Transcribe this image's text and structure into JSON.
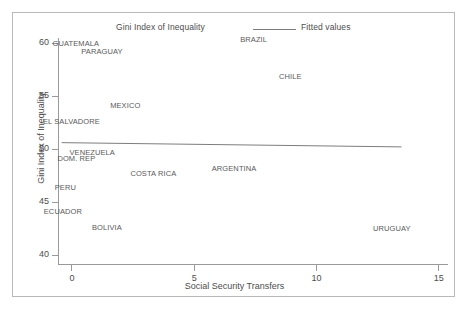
{
  "chart_data": {
    "type": "scatter",
    "title": "",
    "xlabel": "Social Security Transfers",
    "ylabel": "Gini Index of Inequality",
    "xlim": [
      -0.55,
      15.4
    ],
    "ylim": [
      39.2,
      60.9
    ],
    "xticks": [
      "0",
      "5",
      "10",
      "15"
    ],
    "xtick_values": [
      0,
      5,
      10,
      15
    ],
    "yticks": [
      "40",
      "45",
      "50",
      "55",
      "60"
    ],
    "ytick_values": [
      40,
      45,
      50,
      55,
      60
    ],
    "grid": false,
    "legend_position": "top",
    "legend": [
      {
        "name": "Gini Index of Inequality",
        "marker": "text-label"
      },
      {
        "name": "Fitted values",
        "marker": "line"
      }
    ],
    "point_marker_style": "country-name-text",
    "points": [
      {
        "label": "GUATEMALA",
        "x": 0.18,
        "y": 59.95
      },
      {
        "label": "PARAGUAY",
        "x": 1.25,
        "y": 59.2
      },
      {
        "label": "BRAZIL",
        "x": 7.45,
        "y": 60.3
      },
      {
        "label": "CHILE",
        "x": 8.95,
        "y": 56.85
      },
      {
        "label": "MEXICO",
        "x": 2.2,
        "y": 54.1
      },
      {
        "label": "EL SALVADORE",
        "x": 0.0,
        "y": 52.65
      },
      {
        "label": "VENEZUELA",
        "x": 0.85,
        "y": 49.75
      },
      {
        "label": "DOM. REP",
        "x": 0.2,
        "y": 49.15
      },
      {
        "label": "ARGENTINA",
        "x": 6.65,
        "y": 48.25
      },
      {
        "label": "COSTA RICA",
        "x": 3.35,
        "y": 47.75
      },
      {
        "label": "PERU",
        "x": -0.25,
        "y": 46.45
      },
      {
        "label": "ECUADOR",
        "x": -0.35,
        "y": 44.2
      },
      {
        "label": "BOLIVIA",
        "x": 1.45,
        "y": 42.65
      },
      {
        "label": "URUGUAY",
        "x": 13.1,
        "y": 42.55
      }
    ],
    "fitted_line": {
      "name": "Fitted values",
      "x_start": -0.4,
      "y_start": 50.6,
      "x_end": 13.5,
      "y_end": 50.2,
      "color": "#7d7d7d"
    }
  },
  "colors": {
    "axis": "#9a9a9a",
    "text": "#4d4d4d",
    "point_text": "#595959",
    "frame": "#b9b9b9",
    "fit_line": "#7d7d7d",
    "background": "#ffffff"
  }
}
